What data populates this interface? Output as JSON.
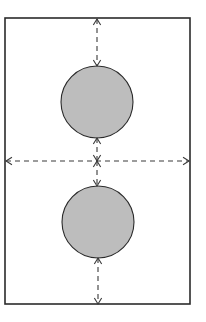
{
  "diagram": {
    "background": "#ffffff",
    "stroke_color": "#2b2b2b",
    "dash_color": "#3a3a3a",
    "circle_fill": "#bdbdbd",
    "frame": {
      "x": 5,
      "y": 18,
      "width": 185,
      "height": 286
    },
    "circles": [
      {
        "name": "top-circle",
        "cx": 97,
        "cy": 102,
        "r": 36
      },
      {
        "name": "bottom-circle",
        "cx": 98,
        "cy": 222,
        "r": 36
      }
    ],
    "dimension_lines": [
      {
        "name": "top-gap-arrow",
        "x1": 97,
        "y1": 19,
        "x2": 97,
        "y2": 66
      },
      {
        "name": "middle-top-gap-arrow",
        "x1": 97,
        "y1": 138,
        "x2": 97,
        "y2": 161
      },
      {
        "name": "middle-bottom-gap-arrow",
        "x1": 97,
        "y1": 161,
        "x2": 97,
        "y2": 186
      },
      {
        "name": "bottom-gap-arrow",
        "x1": 98,
        "y1": 258,
        "x2": 98,
        "y2": 304
      },
      {
        "name": "horizontal-width-arrow",
        "x1": 6,
        "y1": 161,
        "x2": 189,
        "y2": 161
      }
    ]
  }
}
